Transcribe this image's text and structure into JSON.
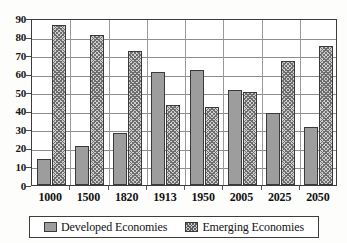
{
  "chart_data": {
    "type": "bar",
    "title": "",
    "subtitle": "",
    "xlabel": "",
    "ylabel": "",
    "categories": [
      "1000",
      "1500",
      "1820",
      "1913",
      "1950",
      "2005",
      "2025",
      "2050"
    ],
    "series": [
      {
        "name": "Developed Economies",
        "color": "#9d9d9d",
        "pattern": "solid",
        "values": [
          14,
          21,
          28,
          61,
          62,
          51,
          39,
          31
        ]
      },
      {
        "name": "Emerging Economies",
        "color": "#cfcfcf",
        "pattern": "crosshatch",
        "values": [
          86,
          81,
          72,
          43,
          42,
          50,
          67,
          75
        ]
      }
    ],
    "ylim": [
      0,
      90
    ],
    "ytick_step": 10,
    "yticks": [
      "0",
      "10",
      "20",
      "30",
      "40",
      "50",
      "60",
      "70",
      "80",
      "90"
    ],
    "grid": true,
    "grid_axis": "y",
    "legend_position": "bottom",
    "legend_entries": [
      "Developed Economies",
      "Emerging Economies"
    ]
  },
  "legend": {
    "developed_label": "Developed Economies",
    "emerging_label": "Emerging Economies"
  }
}
